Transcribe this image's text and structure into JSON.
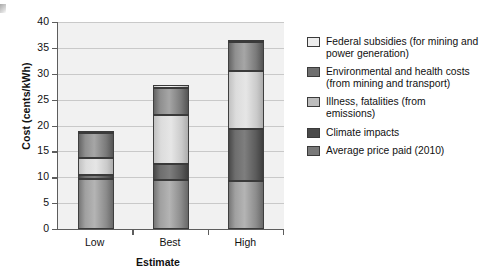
{
  "chart_data": {
    "type": "bar",
    "subtype": "stacked-bar",
    "title": "",
    "xlabel": "Estimate",
    "ylabel": "Cost (cents/kWh)",
    "categories": [
      "Low",
      "Best",
      "High"
    ],
    "ylim": [
      0,
      40
    ],
    "yticks": [
      0,
      5,
      10,
      15,
      20,
      25,
      30,
      35,
      40
    ],
    "grid": "horizontal",
    "legend_position": "right",
    "stack_order_bottom_to_top": [
      "Average price paid (2010)",
      "Climate impacts",
      "Illness, fatalities (from emissions)",
      "Environmental and health costs (from mining and transport)",
      "Federal subsidies (for mining and power generation)"
    ],
    "series": [
      {
        "name": "Average price paid (2010)",
        "color": "#8c8c8c",
        "values": [
          9.7,
          9.5,
          9.3
        ]
      },
      {
        "name": "Climate impacts",
        "color": "#5b5b5b",
        "values": [
          0.7,
          3.0,
          10.1
        ]
      },
      {
        "name": "Illness, fatalities (from emissions)",
        "color": "#cfcfcf",
        "values": [
          3.4,
          9.5,
          11.2
        ]
      },
      {
        "name": "Environmental and health costs (from mining and transport)",
        "color": "#8f8f8f",
        "values": [
          4.7,
          5.3,
          5.5
        ]
      },
      {
        "name": "Federal subsidies (for mining and power generation)",
        "color": "#ededed",
        "values": [
          0.2,
          0.5,
          0.2
        ]
      }
    ],
    "totals": [
      18.7,
      27.8,
      36.3
    ]
  },
  "axes": {
    "ylabel": "Cost (cents/kWh)",
    "xlabel": "Estimate",
    "ytick_labels": [
      "40",
      "35",
      "30",
      "25",
      "20",
      "15",
      "10",
      "5",
      "0"
    ],
    "xtick_labels": [
      "Low",
      "Best",
      "High"
    ]
  },
  "legend": {
    "items": [
      {
        "label": "Federal subsidies (for mining and power generation)",
        "line1": "Federal subsidies (for mining and",
        "line2": "power generation)",
        "swatch": "#ededed",
        "swatch_name": "legend-swatch-federal-subsidies"
      },
      {
        "label": "Environmental and health costs (from mining and transport)",
        "line1": "Environmental and health costs",
        "line2": "(from mining and transport)",
        "swatch": "#6f6f6f",
        "swatch_name": "legend-swatch-environmental-health"
      },
      {
        "label": "Illness, fatalities (from emissions)",
        "line1": "Illness, fatalities (from",
        "line2": "emissions)",
        "swatch": "#bcbcbc",
        "swatch_name": "legend-swatch-illness-fatalities"
      },
      {
        "label": "Climate impacts",
        "line1": "Climate impacts",
        "line2": "",
        "swatch": "#4a4a4a",
        "swatch_name": "legend-swatch-climate-impacts"
      },
      {
        "label": "Average price paid (2010)",
        "line1": "Average price paid (2010)",
        "line2": "",
        "swatch": "#797979",
        "swatch_name": "legend-swatch-average-price-paid"
      }
    ]
  }
}
